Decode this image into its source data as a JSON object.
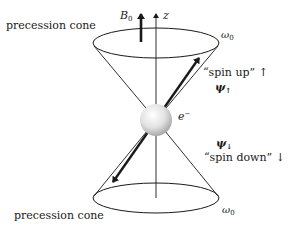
{
  "labels": {
    "cone_top": "precession cone",
    "cone_bottom": "precession cone",
    "field": {
      "symbol": "B",
      "subscript": "0"
    },
    "axis": "z",
    "omega_top": {
      "symbol": "ω",
      "subscript": "0"
    },
    "omega_bottom": {
      "symbol": "ω",
      "subscript": "0"
    },
    "spin_up": "“spin up” ↑",
    "psi_up": {
      "symbol": "ψ",
      "subscript": "↑"
    },
    "electron": {
      "symbol": "e",
      "superscript": "−"
    },
    "psi_down": {
      "symbol": "ψ",
      "subscript": "↓"
    },
    "spin_down": "“spin down” ↓"
  },
  "colors": {
    "line": "#1a1a1a",
    "sphere_light": "#ffffff",
    "sphere_dark": "#a8a8a8"
  }
}
